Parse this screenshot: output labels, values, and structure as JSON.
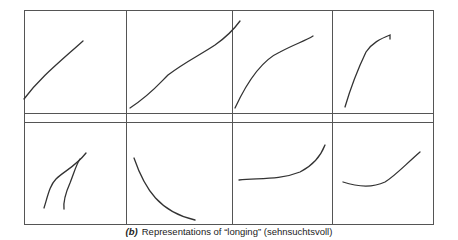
{
  "figure": {
    "label": "(b)",
    "caption": "Representations of “longing” (sehnsuchtsvoll)",
    "grid": {
      "rows": 2,
      "cols": 4
    },
    "panels": [
      {
        "row": 1,
        "col": 1,
        "shape": "straight rising line"
      },
      {
        "row": 1,
        "col": 2,
        "shape": "long rising line"
      },
      {
        "row": 1,
        "col": 3,
        "shape": "concave rising curve"
      },
      {
        "row": 1,
        "col": 4,
        "shape": "steep concave rising curve with hook"
      },
      {
        "row": 2,
        "col": 1,
        "shape": "two converging strokes"
      },
      {
        "row": 2,
        "col": 2,
        "shape": "falling convex curve"
      },
      {
        "row": 2,
        "col": 3,
        "shape": "flat then rising curve"
      },
      {
        "row": 2,
        "col": 4,
        "shape": "dip then rising curve"
      }
    ]
  }
}
